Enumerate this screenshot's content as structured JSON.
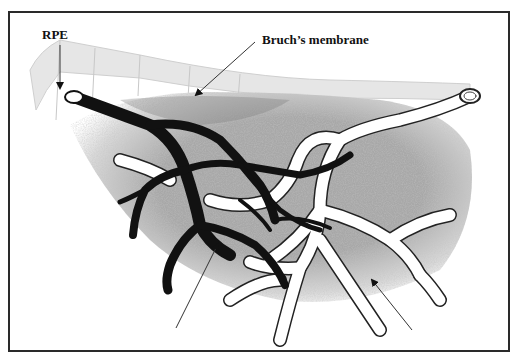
{
  "figure": {
    "labels": {
      "rpe": "RPE",
      "bruchs_membrane": "Bruch’s membrane"
    },
    "unlabeled_arrows": 2,
    "colors": {
      "frame": "#2a2a2a",
      "arteriole": "#111111",
      "venule_fill": "#ffffff",
      "venule_outline": "#222222",
      "tissue": "#a9a9a9",
      "rpe_layer": "#e4e4e4",
      "background": "#ffffff"
    }
  }
}
